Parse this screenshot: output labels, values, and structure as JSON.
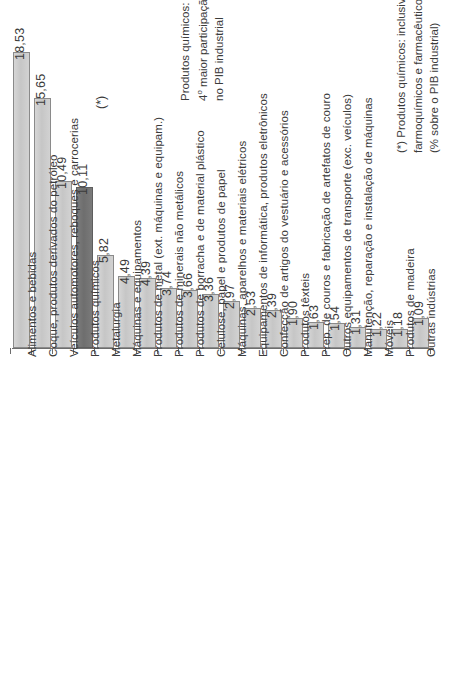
{
  "chart_data": {
    "type": "bar",
    "title": "",
    "subtitle": "",
    "xlabel": "",
    "ylabel": "",
    "ylim": [
      0,
      18.53
    ],
    "grid": false,
    "legend": null,
    "orientation": "vertical",
    "value_format": "comma-decimal",
    "categories": [
      "Alimentos e bebidas",
      "Coque, produtos derivados do petróleo",
      "Veículos automotores, reboques e carrocerias",
      "Produtos químicos",
      "Metalurgia",
      "Máquinas e equipamentos",
      "Produtos de metal (ext. máquinas e equipam.)",
      "Produtos de minerais não metálicos",
      "Produtos de borracha e de material plástico",
      "Celulose, papel e produtos de papel",
      "Máquinas, aparelhos e materiais elétricos",
      "Equipamentos de informática, produtos eletrônicos",
      "Confecção de artigos do vestuário e acessórios",
      "Produtos têxteis",
      "Prep. de couros e fabricação de artefatos de couro",
      "Outros equipamentos de transporte (exc. veículos)",
      "Manutenção, reparação e instalação de máquinas",
      "Móveis",
      "Produtos de madeira",
      "Outras indústrias"
    ],
    "values": [
      18.53,
      15.65,
      10.49,
      10.11,
      5.82,
      4.49,
      4.39,
      3.74,
      3.66,
      3.36,
      2.97,
      2.53,
      2.39,
      1.9,
      1.63,
      1.54,
      1.31,
      1.22,
      1.18,
      1.09
    ],
    "value_labels": [
      "18,53",
      "15,65",
      "10,49",
      "10,11",
      "5,82",
      "4,49",
      "4,39",
      "3,74",
      "3,66",
      "3,36",
      "2,97",
      "2,53",
      "2,39",
      "1,90",
      "1,63",
      "1,54",
      "1,31",
      "1,22",
      "1,18",
      "1,09"
    ],
    "highlight_index": 3,
    "highlight_marker": "(*)",
    "colors": {
      "bar": "#cccccc",
      "bar_border": "#8a8a8a",
      "highlight_bar": "#777777",
      "highlight_border": "#5e5e5e",
      "axis": "#6d6d6d",
      "text": "#3b3b3b",
      "background": "#ffffff"
    }
  },
  "annotation": {
    "line1": "Produtos químicos:",
    "line2_prefix": "4",
    "line2_sup": "o",
    "line2_rest": " maior participação",
    "line3": "no PIB industrial"
  },
  "footnote": {
    "line1": "(*) Produtos químicos: inclusive",
    "line2": "farmoquímicos e farmacêuticos.",
    "line3": "(% sobre o PIB industrial)"
  }
}
